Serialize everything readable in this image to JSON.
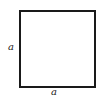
{
  "diagram": {
    "shape": "square",
    "stroke_color": "#1a1a1a",
    "fill_color": "#ffffff",
    "labels": {
      "left_side": "a",
      "bottom_side": "a"
    }
  }
}
